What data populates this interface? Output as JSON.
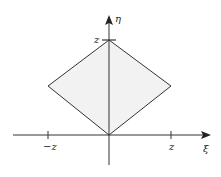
{
  "diagram": {
    "axes": {
      "x_label": "ξ",
      "y_label": "η"
    },
    "tick_labels": {
      "x_neg": "−z",
      "x_pos": "z",
      "y_top": "z"
    },
    "region": {
      "shape": "diamond",
      "vertices": [
        [
          0,
          0
        ],
        [
          "z",
          "z/2"
        ],
        [
          0,
          "z"
        ],
        [
          "-z",
          "z/2"
        ]
      ],
      "fill": "#f2f2f2",
      "stroke": "#333333"
    }
  }
}
